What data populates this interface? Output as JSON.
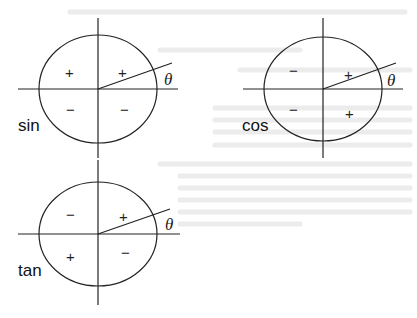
{
  "figure": {
    "angle_label": "θ",
    "panels": [
      {
        "function": "sin",
        "quadrants": {
          "Q1": "+",
          "Q2": "+",
          "Q3": "−",
          "Q4": "−"
        }
      },
      {
        "function": "cos",
        "quadrants": {
          "Q1": "+",
          "Q2": "−",
          "Q3": "−",
          "Q4": "+"
        }
      },
      {
        "function": "tan",
        "quadrants": {
          "Q1": "+",
          "Q2": "−",
          "Q3": "+",
          "Q4": "−"
        }
      }
    ]
  },
  "colors": {
    "ink": "#222222",
    "background": "#ffffff",
    "bleed_through": "#e6e6e6"
  }
}
